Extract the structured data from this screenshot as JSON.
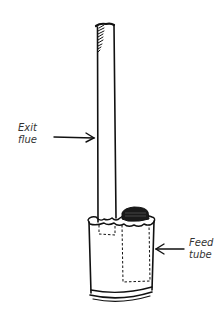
{
  "diagram": {
    "labels": {
      "exit_flue": {
        "line1": "Exit",
        "line2": "flue"
      },
      "feed_tube": {
        "line1": "Feed",
        "line2": "tube"
      }
    },
    "colors": {
      "ink": "#111111",
      "label_text": "#333333",
      "background": "#ffffff"
    }
  }
}
